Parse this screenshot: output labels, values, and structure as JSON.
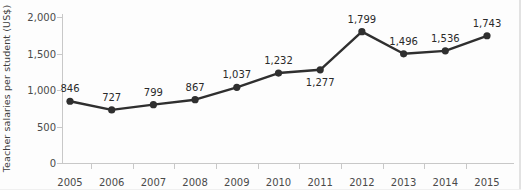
{
  "chart_data": {
    "type": "line",
    "title": "",
    "xlabel": "",
    "ylabel": "Teacher salaries per student (US$)",
    "categories": [
      "2005",
      "2006",
      "2007",
      "2008",
      "2009",
      "2010",
      "2011",
      "2012",
      "2013",
      "2014",
      "2015"
    ],
    "values": [
      846,
      727,
      799,
      867,
      1037,
      1232,
      1277,
      1799,
      1496,
      1536,
      1743
    ],
    "value_labels": [
      "846",
      "727",
      "799",
      "867",
      "1,037",
      "1,232",
      "1,277",
      "1,799",
      "1,496",
      "1,536",
      "1,743"
    ],
    "label_positions": [
      "above",
      "above",
      "above",
      "above",
      "above",
      "above",
      "below",
      "above",
      "above",
      "above",
      "above"
    ],
    "ylim": [
      0,
      2000
    ],
    "y_ticks": [
      0,
      500,
      1000,
      1500,
      2000
    ],
    "y_tick_labels": [
      "0",
      "500",
      "1,000",
      "1,500",
      "2,000"
    ],
    "grid": false,
    "legend": false,
    "series_color": "#2f2f2f",
    "axis_color": "#c8c8c8",
    "marker": "circle"
  }
}
